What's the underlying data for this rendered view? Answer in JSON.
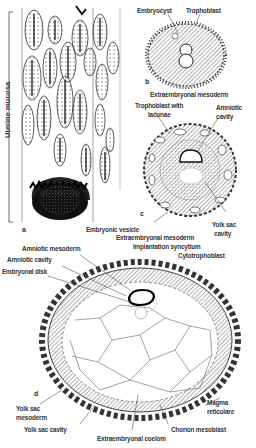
{
  "figure": {
    "panel_a": {
      "letter": "a",
      "labels": {
        "uterine_mucosa": "Uterine mucosa",
        "embryonic_vesicle": "Embryonic vesicle"
      }
    },
    "panel_b": {
      "letter": "b",
      "labels": {
        "embryocyst": "Embryocyst",
        "trophoblast": "Trophoblast",
        "extraembryonal_mesoderm": "Extraembryonal mesoderm"
      }
    },
    "panel_c": {
      "letter": "c",
      "labels": {
        "trophoblast_with_lacunae_1": "Trophoblast with",
        "trophoblast_with_lacunae_2": "lacunae",
        "amniotic_cavity_1": "Amniotic",
        "amniotic_cavity_2": "cavity",
        "yolk_sac_cavity_1": "Yolk sac",
        "yolk_sac_cavity_2": "cavity",
        "extraembryonal_mesoderm": "Extraembryonal mesoderm",
        "implantation_syncytium": "Implantation syncytium",
        "cytotrophoblast": "Cytotrophoblast"
      }
    },
    "panel_d": {
      "letter": "d",
      "labels": {
        "amniotic_mesoderm": "Amniotic mesoderm",
        "amniotic_cavity": "Amniotic cavity",
        "embryonal_disk": "Embryonal disk",
        "yolk_sac_mesoderm_1": "Yolk sac",
        "yolk_sac_mesoderm_2": "mesoderm",
        "yolk_sac_cavity": "Yolk sac cavity",
        "extraembryonal_coelom": "Extraembryonal coelom",
        "chorion_mesoblast": "Chorion mesoblast",
        "magma_reticulare_1": "Magma",
        "magma_reticulare_2": "reticulare"
      }
    }
  }
}
